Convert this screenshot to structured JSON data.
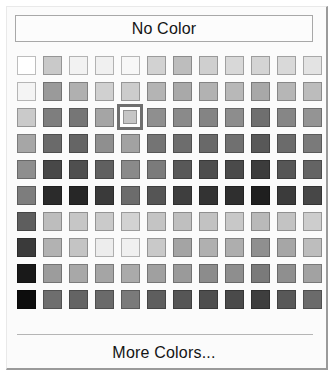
{
  "panel": {
    "name": "color-picker-popup",
    "background": "#fbfbfb",
    "border_light": "#e9e9e9",
    "border_dark": "#9a9a9a"
  },
  "no_color": {
    "label": "No Color"
  },
  "more_colors": {
    "label": "More Colors..."
  },
  "palette": {
    "columns": 12,
    "rows": 10,
    "selection": {
      "row": 3,
      "column": 5,
      "highlight_color": "#6f6f6f"
    },
    "swatches": [
      [
        "#ffffff",
        "#c9c9c9",
        "#f2f2f2",
        "#f0f0f0",
        "#f7f7f7",
        "#d2d2d2",
        "#bdbdbd",
        "#cfcfcf",
        "#d8d8d8",
        "#d4d4d4",
        "#d9d9d9",
        "#e3e3e3"
      ],
      [
        "#f4f4f4",
        "#9a9a9a",
        "#b0b0b0",
        "#d0d0d0",
        "#cccccc",
        "#b4b4b4",
        "#a9a9a9",
        "#b2b2b2",
        "#b8b8b8",
        "#a8a8a8",
        "#b6b6b6",
        "#bcbcbc"
      ],
      [
        "#cacaca",
        "#7e7e7e",
        "#767676",
        "#a5a5a5",
        "#c6c6c6",
        "#8f8f8f",
        "#8a8a8a",
        "#848484",
        "#8d8d8d",
        "#6f6f6f",
        "#868686",
        "#949494"
      ],
      [
        "#a6a6a6",
        "#6a6a6a",
        "#656565",
        "#8f8f8f",
        "#a2a2a2",
        "#747474",
        "#6d6d6d",
        "#696969",
        "#707070",
        "#585858",
        "#6b6b6b",
        "#7a7a7a"
      ],
      [
        "#8e8e8e",
        "#484848",
        "#4f4f4f",
        "#606060",
        "#8a8a8a",
        "#7b7b7b",
        "#585858",
        "#4d4d4d",
        "#4a4a4a",
        "#3c3c3c",
        "#565656",
        "#646464"
      ],
      [
        "#7d7d7d",
        "#2b2b2b",
        "#272727",
        "#3a3a3a",
        "#6c6c6c",
        "#555555",
        "#3e3e3e",
        "#333333",
        "#2f2f2f",
        "#1f1f1f",
        "#3b3b3b",
        "#474747"
      ],
      [
        "#5e5e5e",
        "#bdbdbd",
        "#c6c6c6",
        "#cacaca",
        "#d2d2d2",
        "#c4c4c4",
        "#bfbfbf",
        "#c2c2c2",
        "#c8c8c8",
        "#b9b9b9",
        "#c3c3c3",
        "#cdcdcd"
      ],
      [
        "#3a3a3a",
        "#b2b2b2",
        "#c4c4c4",
        "#ededed",
        "#f0f0f0",
        "#c9c9c9",
        "#a4a4a4",
        "#b0b0b0",
        "#aeaeae",
        "#8f8f8f",
        "#a6a6a6",
        "#bdbdbd"
      ],
      [
        "#191919",
        "#9c9c9c",
        "#a8a8a8",
        "#a5a5a5",
        "#aaaaaa",
        "#a0a0a0",
        "#9a9a9a",
        "#8c8c8c",
        "#8e8e8e",
        "#7a7a7a",
        "#8f8f8f",
        "#a2a2a2"
      ],
      [
        "#0d0d0d",
        "#6e6e6e",
        "#646464",
        "#6a6a6a",
        "#7a7a7a",
        "#5e5e5e",
        "#565656",
        "#4e4e4e",
        "#4a4a4a",
        "#3e3e3e",
        "#585858",
        "#6b6b6b"
      ]
    ]
  }
}
